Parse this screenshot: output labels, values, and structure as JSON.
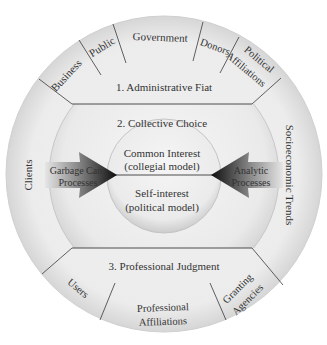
{
  "diagram": {
    "outer_ring": {
      "top_segments": [
        {
          "label": "Business"
        },
        {
          "label": "Public"
        },
        {
          "label": "Government"
        },
        {
          "label": "Donors"
        },
        {
          "label_line1": "Political",
          "label_line2": "Affiliations"
        }
      ],
      "left_segment": {
        "label": "Clients"
      },
      "right_segment": {
        "label": "Socioeconomic Trends"
      },
      "bottom_segments": [
        {
          "label": "Users"
        },
        {
          "label_line1": "Professional",
          "label_line2": "Affiliations"
        },
        {
          "label_line1": "Granting",
          "label_line2": "Agencies"
        }
      ]
    },
    "middle_ring": {
      "top_label": "1. Administrative Fiat",
      "center_label": "2. Collective Choice",
      "bottom_label": "3. Professional Judgment"
    },
    "inner_circle": {
      "upper_line1": "Common Interest",
      "upper_line2": "(collegial model)",
      "lower_line1": "Self-interest",
      "lower_line2": "(political model)"
    },
    "arrows": {
      "left": {
        "line1": "Garbage Can",
        "line2": "Processes"
      },
      "right": {
        "line1": "Analytic",
        "line2": "Processes"
      }
    },
    "colors": {
      "ring_light": "#f2f2f2",
      "ring_mid": "#e4e4e4",
      "ring_shadow": "#cfcfcf",
      "line": "#3a3a3a",
      "text": "#333333",
      "arrow_dark": "#111111"
    }
  }
}
